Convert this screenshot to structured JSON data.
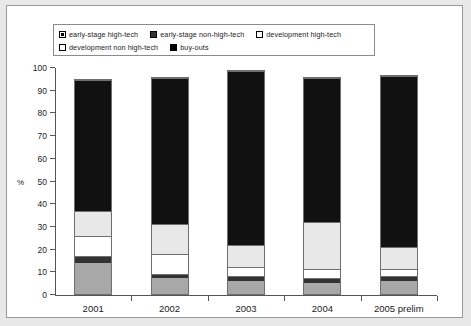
{
  "legend": {
    "rows": [
      [
        {
          "label": "early-stage high-tech",
          "marker": "gray-square-icon",
          "color": "#a8a8a8",
          "style": "inner"
        },
        {
          "label": "early-stage non-high-tech",
          "marker": "dark-square-icon",
          "color": "#333333",
          "style": "solid"
        },
        {
          "label": "development high-tech",
          "marker": "white-square-icon",
          "color": "#ffffff",
          "style": "open"
        }
      ],
      [
        {
          "label": "development non high-tech",
          "marker": "light-square-icon",
          "color": "#ffffff",
          "style": "open"
        },
        {
          "label": "buy-outs",
          "marker": "black-square-icon",
          "color": "#000000",
          "style": "solid"
        }
      ]
    ]
  },
  "chart_data": {
    "type": "bar",
    "stacked": true,
    "title": "",
    "xlabel": "",
    "ylabel": "%",
    "ylim": [
      0,
      100
    ],
    "yticks": [
      0,
      10,
      20,
      30,
      40,
      50,
      60,
      70,
      80,
      90,
      100
    ],
    "grid": false,
    "legend_position": "top",
    "categories": [
      "2001",
      "2002",
      "2003",
      "2004",
      "2005 prelim"
    ],
    "series": [
      {
        "name": "early-stage high-tech",
        "color": "#a8a8a8",
        "values": [
          14,
          7,
          6,
          5,
          6
        ]
      },
      {
        "name": "early-stage non-high-tech",
        "color": "#333333",
        "values": [
          3,
          2,
          2,
          2,
          2
        ]
      },
      {
        "name": "development high-tech",
        "color": "#ffffff",
        "values": [
          9,
          9,
          4,
          4,
          3
        ]
      },
      {
        "name": "development non high-tech",
        "color": "#e8e8e8",
        "values": [
          11,
          13,
          10,
          21,
          10
        ]
      },
      {
        "name": "buy-outs",
        "color": "#111111",
        "values": [
          58,
          65,
          77,
          64,
          76
        ]
      }
    ],
    "totals": [
      95,
      96,
      99,
      96,
      97
    ]
  }
}
